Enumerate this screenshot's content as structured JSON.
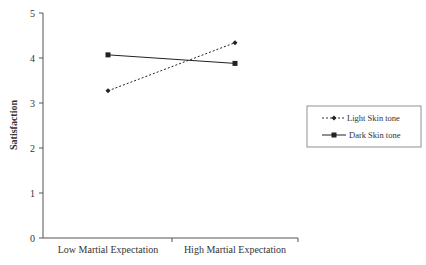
{
  "chart_data": {
    "type": "line",
    "title": "",
    "xlabel": "",
    "ylabel": "Satisfaction",
    "ylim": [
      0,
      5
    ],
    "yticks": [
      0,
      1,
      2,
      3,
      4,
      5
    ],
    "categories": [
      "Low Martial Expectation",
      "High Martial Expectation"
    ],
    "series": [
      {
        "name": "Light Skin tone",
        "values": [
          3.27,
          4.34
        ],
        "line": "dashed",
        "marker": "diamond"
      },
      {
        "name": "Dark Skin tone",
        "values": [
          4.07,
          3.88
        ],
        "line": "solid",
        "marker": "square"
      }
    ],
    "grid": false,
    "legend_position": "right"
  }
}
